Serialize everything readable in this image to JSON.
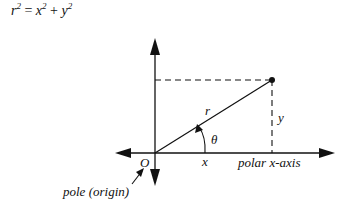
{
  "formula": {
    "r": "r",
    "r_exp": "2",
    "eq": "=",
    "x": "x",
    "x_exp": "2",
    "plus": "+",
    "y": "y",
    "y_exp": "2"
  },
  "diagram": {
    "labels": {
      "r": "r",
      "theta": "θ",
      "x": "x",
      "y": "y",
      "origin": "O",
      "polar_axis": "polar x-axis",
      "pole": "pole (origin)"
    },
    "colors": {
      "line": "#111111",
      "background": "#ffffff"
    }
  }
}
